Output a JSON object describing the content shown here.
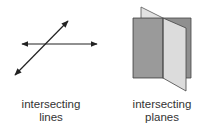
{
  "figures": [
    {
      "id": "lines",
      "caption_line1": "intersecting",
      "caption_line2": "lines",
      "stroke_color": "#222222"
    },
    {
      "id": "planes",
      "caption_line1": "intersecting",
      "caption_line2": "planes",
      "back_plane_color": "#8c8c8c",
      "front_plane_color": "#d6d6d6",
      "edge_color": "#333333"
    }
  ]
}
